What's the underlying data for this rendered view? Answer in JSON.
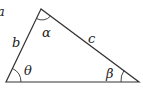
{
  "diagram": {
    "type": "triangle",
    "stroke_color": "#333333",
    "vertices": {
      "top": [
        41,
        9
      ],
      "bottom_left": [
        6,
        82
      ],
      "bottom_right": [
        139,
        82
      ]
    },
    "side_labels": {
      "left": "b",
      "right": "c",
      "bottom": "a",
      "top_left_partial": "a"
    },
    "angle_labels": {
      "top": "α",
      "bottom_left": "θ",
      "bottom_right": "β"
    }
  }
}
